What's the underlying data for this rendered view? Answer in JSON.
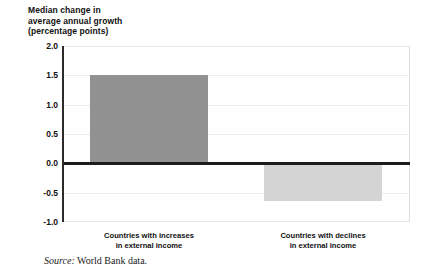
{
  "chart_data": {
    "type": "bar",
    "title": "Median change in average annual growth (percentage points)",
    "title_lines": [
      "Median change in",
      "average annual growth",
      "(percentage points)"
    ],
    "categories": [
      "Countries with increases in external income",
      "Countries with declines in external income"
    ],
    "category_lines": [
      [
        "Countries with increases",
        "in external income"
      ],
      [
        "Countries with declines",
        "in external income"
      ]
    ],
    "values": [
      1.5,
      -0.65
    ],
    "xlabel": "",
    "ylabel": "Median change in average annual growth (percentage points)",
    "ylim": [
      -1.0,
      2.0
    ],
    "ytick_values": [
      2.0,
      1.5,
      1.0,
      0.5,
      0.0,
      -0.5,
      -1.0
    ],
    "ytick_labels": [
      "2.0",
      "1.5",
      "1.0",
      "0.5",
      "0.0",
      "-0.5",
      "-1.0"
    ],
    "grid": true,
    "legend": "none",
    "bar_colors": [
      "#919191",
      "#d4d4d4"
    ],
    "zero_line_color": "#1c1c1c",
    "gridline_color": "#ececec",
    "axis_color": "#2b2b2b",
    "text_color": "#111111"
  },
  "source": {
    "label": "Source:",
    "text": "World Bank data."
  }
}
